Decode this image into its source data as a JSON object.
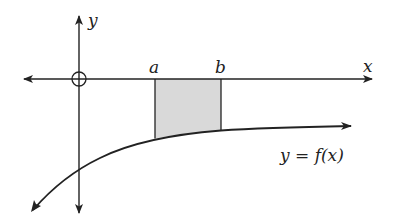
{
  "diagram": {
    "type": "area-under-curve",
    "axes": {
      "x_label": "x",
      "y_label": "y",
      "origin_marker": "circle"
    },
    "bounds": {
      "a_label": "a",
      "b_label": "b"
    },
    "curve": {
      "label": "y = f(x)",
      "description": "increasing curve below the x-axis, approaching a horizontal asymptote"
    },
    "shaded_region": {
      "description": "region between x-axis and curve from a to b",
      "fill": "#d9d9d9"
    },
    "colors": {
      "stroke": "#222222",
      "shade": "#d9d9d9"
    }
  }
}
